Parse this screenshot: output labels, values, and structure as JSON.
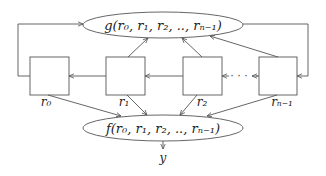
{
  "diagram": {
    "top_node": {
      "label": "g(r₀, r₁, r₂, .., rₙ₋₁)"
    },
    "bottom_node": {
      "label": "f(r₀, r₁, r₂, .., rₙ₋₁)"
    },
    "registers": [
      {
        "label": "r₀"
      },
      {
        "label": "r₁"
      },
      {
        "label": "r₂"
      },
      {
        "label": "rₙ₋₁"
      }
    ],
    "ellipsis": "· · ·",
    "output": {
      "label": "y"
    },
    "colors": {
      "stroke": "#555555",
      "text": "#222222",
      "background": "#ffffff"
    }
  }
}
